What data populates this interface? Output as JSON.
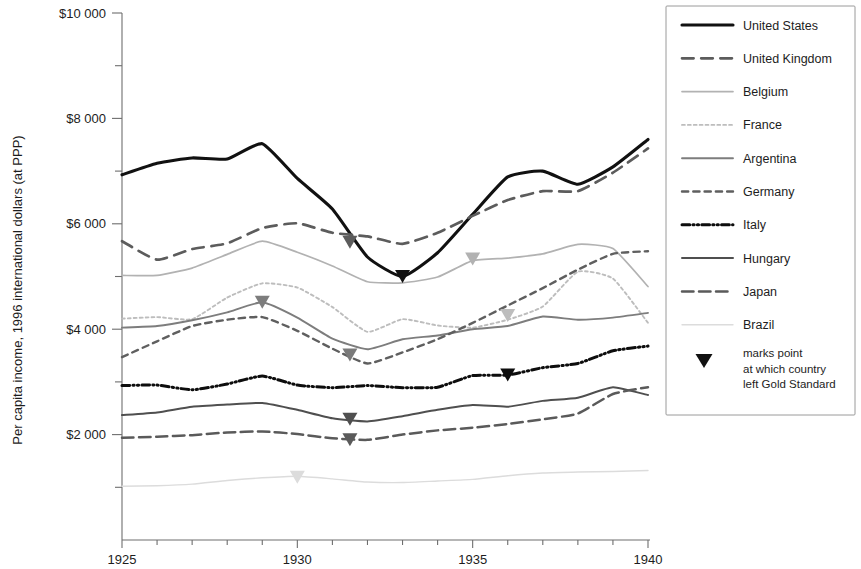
{
  "chart_data": {
    "type": "line",
    "title": "",
    "xlabel": "",
    "ylabel": "Per capita income, 1996 international dollars (at PPP)",
    "xlim": [
      1925,
      1940
    ],
    "ylim": [
      0,
      10000
    ],
    "grid": false,
    "x_tick_labels": [
      "1925",
      "1930",
      "1935",
      "1940"
    ],
    "x_tick_values": [
      1925,
      1930,
      1935,
      1940
    ],
    "x_minor_tick_step": 1,
    "y_tick_labels": [
      "$2 000",
      "$4 000",
      "$6 000",
      "$8 000",
      "$10 000"
    ],
    "y_tick_values": [
      2000,
      4000,
      6000,
      8000,
      10000
    ],
    "y_minor_tick_step": 1000,
    "legend_position": "right",
    "x": [
      1925,
      1926,
      1927,
      1928,
      1929,
      1930,
      1931,
      1932,
      1933,
      1934,
      1935,
      1936,
      1937,
      1938,
      1939,
      1940
    ],
    "series": [
      {
        "name": "United States",
        "style": "solid",
        "color": "#111111",
        "width": 3.1,
        "values": [
          6930,
          7150,
          7250,
          7230,
          7520,
          6860,
          6280,
          5370,
          5000,
          5450,
          6180,
          6890,
          7000,
          6750,
          7080,
          7600
        ],
        "gold_standard_year": 1933,
        "gold_standard_value": 5000,
        "marker_color": "#111111"
      },
      {
        "name": "United Kingdom",
        "style": "dashed",
        "color": "#5c5c5c",
        "width": 2.7,
        "values": [
          5670,
          5320,
          5520,
          5630,
          5920,
          6010,
          5830,
          5760,
          5620,
          5830,
          6150,
          6450,
          6620,
          6620,
          6970,
          7430
        ],
        "gold_standard_year": 1931.5,
        "gold_standard_value": 5650,
        "marker_color": "#5c5c5c"
      },
      {
        "name": "Belgium",
        "style": "solid-light",
        "color": "#b2b2b2",
        "width": 1.7,
        "values": [
          5020,
          5020,
          5160,
          5420,
          5670,
          5460,
          5200,
          4900,
          4880,
          4990,
          5300,
          5350,
          5430,
          5610,
          5530,
          4810
        ],
        "gold_standard_year": 1935,
        "gold_standard_value": 5330,
        "marker_color": "#b2b2b2"
      },
      {
        "name": "France",
        "style": "dotted-light",
        "color": "#bdbdbd",
        "width": 1.9,
        "values": [
          4200,
          4230,
          4190,
          4600,
          4870,
          4790,
          4420,
          3950,
          4190,
          4070,
          4030,
          4180,
          4430,
          5090,
          4960,
          4120
        ],
        "gold_standard_year": 1936,
        "gold_standard_value": 4260,
        "marker_color": "#bdbdbd"
      },
      {
        "name": "Argentina",
        "style": "solid-mid",
        "color": "#7d7d7d",
        "width": 1.9,
        "values": [
          4030,
          4060,
          4170,
          4320,
          4510,
          4220,
          3820,
          3620,
          3810,
          3880,
          4000,
          4060,
          4240,
          4180,
          4220,
          4310
        ],
        "gold_standard_year": 1929,
        "gold_standard_value": 4510,
        "marker_color": "#7d7d7d"
      },
      {
        "name": "Germany",
        "style": "dashed-fine",
        "color": "#5f5f5f",
        "width": 2.4,
        "values": [
          3470,
          3770,
          4060,
          4180,
          4230,
          3970,
          3630,
          3350,
          3560,
          3810,
          4120,
          4450,
          4780,
          5130,
          5430,
          5480
        ],
        "gold_standard_year": 1931.5,
        "gold_standard_value": 3510,
        "marker_color": "#7a7a7a"
      },
      {
        "name": "Italy",
        "style": "dashdotdot",
        "color": "#0d0d0d",
        "width": 3.0,
        "values": [
          2930,
          2940,
          2850,
          2960,
          3110,
          2940,
          2890,
          2930,
          2890,
          2900,
          3120,
          3130,
          3270,
          3350,
          3590,
          3680
        ],
        "gold_standard_year": 1936,
        "gold_standard_value": 3130,
        "marker_color": "#0d0d0d"
      },
      {
        "name": "Hungary",
        "style": "solid-dark",
        "color": "#4f4f4f",
        "width": 2.0,
        "values": [
          2370,
          2420,
          2530,
          2570,
          2600,
          2470,
          2310,
          2250,
          2350,
          2470,
          2560,
          2530,
          2640,
          2700,
          2900,
          2750
        ],
        "gold_standard_year": 1931.5,
        "gold_standard_value": 2290,
        "marker_color": "#4f4f4f"
      },
      {
        "name": "Japan",
        "style": "long-dash",
        "color": "#5a5a5a",
        "width": 2.5,
        "values": [
          1940,
          1960,
          1990,
          2040,
          2060,
          2010,
          1930,
          1900,
          2000,
          2080,
          2130,
          2200,
          2290,
          2400,
          2770,
          2900
        ],
        "gold_standard_year": 1931.5,
        "gold_standard_value": 1900,
        "marker_color": "#5a5a5a"
      },
      {
        "name": "Brazil",
        "style": "solid-faint",
        "color": "#dcdcdc",
        "width": 1.4,
        "values": [
          1020,
          1030,
          1060,
          1130,
          1180,
          1210,
          1160,
          1100,
          1090,
          1120,
          1150,
          1220,
          1270,
          1290,
          1300,
          1320
        ],
        "gold_standard_year": 1930,
        "gold_standard_value": 1190,
        "marker_color": "#dcdcdc"
      }
    ],
    "legend_note": [
      "marks point",
      "at which country",
      "left Gold Standard"
    ],
    "marker_shape": "down-triangle"
  }
}
